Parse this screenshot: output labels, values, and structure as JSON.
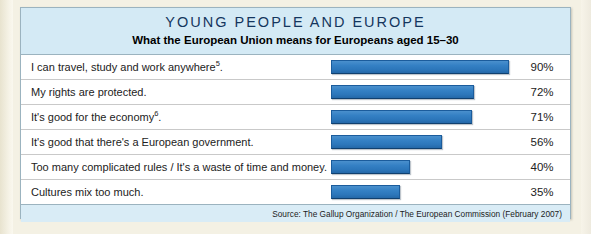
{
  "header": {
    "title": "YOUNG PEOPLE AND EUROPE",
    "subtitle": "What the European Union means for Europeans aged 15–30"
  },
  "source": {
    "text": "Source: The Gallup Organization / The European Commission (February 2007)"
  },
  "colors": {
    "bar": "#2f7ac2",
    "bar_border": "#1b5c9c",
    "header_band": "#d4eaf5",
    "source_band": "#d9ecf6",
    "panel_border": "#9bb3bf",
    "page_background": "#f4f1e4",
    "title_text": "#14365e"
  },
  "chart_data": {
    "type": "bar",
    "title": "YOUNG PEOPLE AND EUROPE",
    "subtitle": "What the European Union means for Europeans aged 15–30",
    "orientation": "horizontal",
    "xlabel": "",
    "ylabel": "",
    "xlim": [
      0,
      100
    ],
    "grid": false,
    "legend": null,
    "value_suffix": "%",
    "categories": [
      "I can travel, study and work anywhere5.",
      "My rights are protected.",
      "It's good for the economy6.",
      "It's good that there's a European government.",
      "Too many complicated rules / It's a waste of time and money.",
      "Cultures mix too much."
    ],
    "values": [
      90,
      72,
      71,
      56,
      40,
      35
    ],
    "rows": [
      {
        "label_before": "I can travel, study and work anywhere",
        "footnote": "5",
        "label_after": ".",
        "value": 90,
        "value_label": "90%"
      },
      {
        "label_before": "My rights are protected.",
        "footnote": "",
        "label_after": "",
        "value": 72,
        "value_label": "72%"
      },
      {
        "label_before": "It's good for the economy",
        "footnote": "6",
        "label_after": ".",
        "value": 71,
        "value_label": "71%"
      },
      {
        "label_before": "It's good that there's a European government.",
        "footnote": "",
        "label_after": "",
        "value": 56,
        "value_label": "56%"
      },
      {
        "label_before": "Too many complicated rules / It's a waste of time and money.",
        "footnote": "",
        "label_after": "",
        "value": 40,
        "value_label": "40%"
      },
      {
        "label_before": "Cultures mix too much.",
        "footnote": "",
        "label_after": "",
        "value": 35,
        "value_label": "35%"
      }
    ],
    "annotation": "Source: The Gallup Organization / The European Commission (February 2007)"
  }
}
